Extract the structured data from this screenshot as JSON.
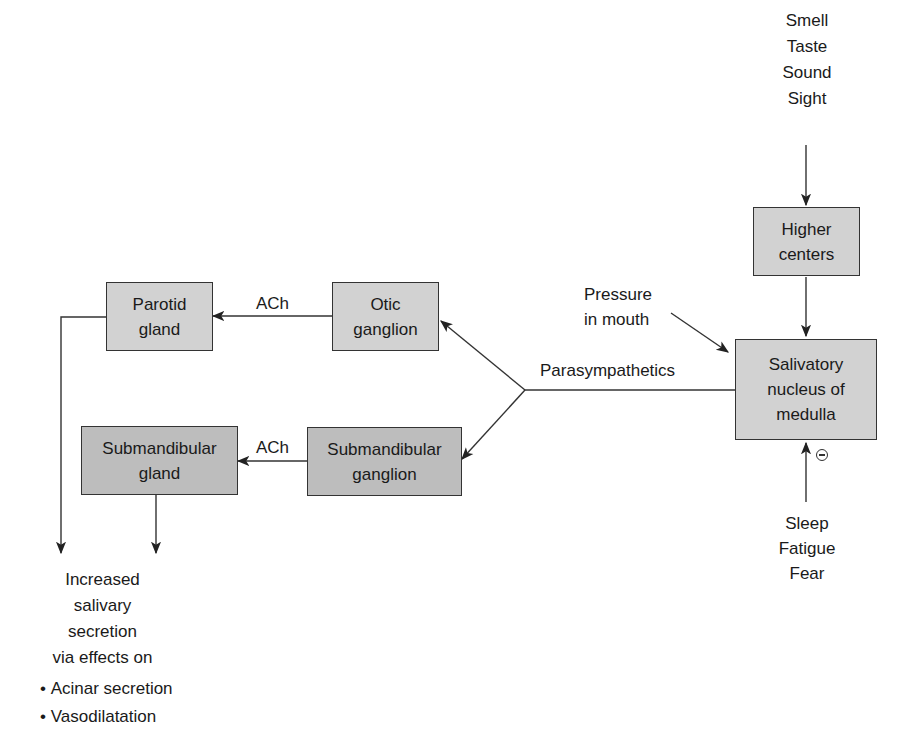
{
  "diagram": {
    "nodes": {
      "higher_centers": "Higher\ncenters",
      "salivatory_nucleus": "Salivatory\nnucleus of\nmedulla",
      "otic_ganglion": "Otic\nganglion",
      "submandibular_ganglion": "Submandibular\nganglion",
      "parotid_gland": "Parotid\ngland",
      "submandibular_gland": "Submandibular\ngland"
    },
    "labels": {
      "stimuli_top": "Smell\nTaste\nSound\nSight",
      "pressure": "Pressure\nin mouth",
      "parasympathetics": "Parasympathetics",
      "ach_top": "ACh",
      "ach_bottom": "ACh",
      "inhibitors": "Sleep\nFatigue\nFear",
      "inhibition_symbol": "⊖",
      "outcome": "Increased\nsalivary\nsecretion\nvia effects on"
    },
    "outcome_effects": [
      "Acinar secretion",
      "Vasodilatation"
    ],
    "colors": {
      "box_light": "#d2d2d2",
      "box_dark": "#bdbdbd",
      "line": "#333333"
    }
  }
}
